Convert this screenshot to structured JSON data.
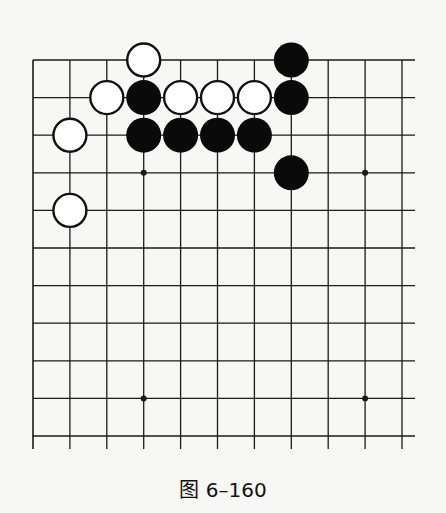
{
  "diagram": {
    "type": "go-board-partial",
    "caption": "图 6–160",
    "grid": {
      "columns": 11,
      "rows": 11,
      "origin_x": 33,
      "origin_y": 60,
      "spacing_x": 36.9,
      "spacing_y": 37.6,
      "line_extend_right": 415,
      "line_extend_bottom": 449
    },
    "star_points": [
      [
        3,
        3
      ],
      [
        9,
        3
      ],
      [
        3,
        9
      ],
      [
        9,
        9
      ]
    ],
    "stones": {
      "white": [
        [
          3,
          0
        ],
        [
          2,
          1
        ],
        [
          4,
          1
        ],
        [
          5,
          1
        ],
        [
          6,
          1
        ],
        [
          1,
          2
        ],
        [
          1,
          4
        ]
      ],
      "black": [
        [
          7,
          0
        ],
        [
          3,
          1
        ],
        [
          7,
          1
        ],
        [
          3,
          2
        ],
        [
          4,
          2
        ],
        [
          5,
          2
        ],
        [
          6,
          2
        ],
        [
          7,
          3
        ]
      ]
    },
    "colors": {
      "line": "#1a1a1a",
      "black": "#0a0a0a",
      "white": "#ffffff",
      "background": "#f7f7f5"
    }
  }
}
